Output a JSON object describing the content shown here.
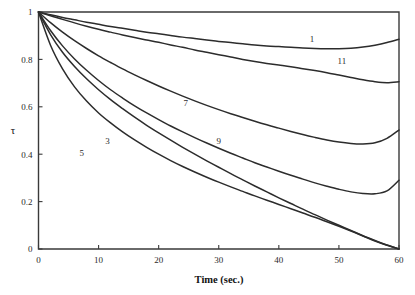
{
  "chart_data": {
    "type": "line",
    "title": "",
    "xlabel": "Time (sec.)",
    "ylabel": "τ",
    "xlim": [
      0,
      60
    ],
    "ylim": [
      0,
      1
    ],
    "xticks": [
      "0",
      "10",
      "20",
      "30",
      "40",
      "50",
      "60"
    ],
    "xtick_values": [
      0,
      10,
      20,
      30,
      40,
      50,
      60
    ],
    "yticks": [
      "0",
      "0.2",
      "0.4",
      "0.6",
      "0.8",
      "1"
    ],
    "ytick_values": [
      0,
      0.2,
      0.4,
      0.6,
      0.8,
      1
    ],
    "grid": false,
    "legend_position": "inline-curve-labels",
    "line_color": "#2c2c2c",
    "axis_color": "#3a3a3a",
    "x": [
      0,
      2,
      4,
      6,
      8,
      10,
      12,
      14,
      16,
      18,
      20,
      22,
      24,
      26,
      28,
      30,
      32,
      34,
      36,
      38,
      40,
      42,
      44,
      46,
      48,
      50,
      52,
      54,
      56,
      58,
      60
    ],
    "series": [
      {
        "name": "1",
        "label": "1",
        "label_x": 45.5,
        "label_y": 0.885,
        "values": [
          1.0,
          0.988,
          0.977,
          0.967,
          0.957,
          0.948,
          0.939,
          0.931,
          0.923,
          0.915,
          0.908,
          0.901,
          0.894,
          0.888,
          0.882,
          0.876,
          0.871,
          0.866,
          0.861,
          0.857,
          0.854,
          0.851,
          0.848,
          0.846,
          0.845,
          0.845,
          0.847,
          0.852,
          0.86,
          0.871,
          0.885
        ]
      },
      {
        "name": "3",
        "label": "3",
        "label_x": 11.5,
        "label_y": 0.455,
        "values": [
          1.0,
          0.905,
          0.83,
          0.77,
          0.718,
          0.672,
          0.63,
          0.592,
          0.556,
          0.522,
          0.49,
          0.459,
          0.429,
          0.4,
          0.372,
          0.345,
          0.318,
          0.292,
          0.266,
          0.241,
          0.216,
          0.192,
          0.168,
          0.145,
          0.122,
          0.1,
          0.078,
          0.056,
          0.036,
          0.017,
          0.0
        ]
      },
      {
        "name": "5",
        "label": "5",
        "label_x": 7.2,
        "label_y": 0.405,
        "values": [
          1.0,
          0.86,
          0.76,
          0.684,
          0.624,
          0.574,
          0.532,
          0.494,
          0.46,
          0.429,
          0.4,
          0.373,
          0.348,
          0.325,
          0.303,
          0.282,
          0.262,
          0.243,
          0.224,
          0.206,
          0.188,
          0.17,
          0.152,
          0.134,
          0.115,
          0.096,
          0.076,
          0.055,
          0.034,
          0.016,
          0.0
        ]
      },
      {
        "name": "7",
        "label": "7",
        "label_x": 24.5,
        "label_y": 0.618,
        "values": [
          1.0,
          0.955,
          0.915,
          0.879,
          0.846,
          0.815,
          0.787,
          0.76,
          0.735,
          0.711,
          0.688,
          0.666,
          0.645,
          0.625,
          0.606,
          0.588,
          0.571,
          0.555,
          0.539,
          0.524,
          0.51,
          0.496,
          0.483,
          0.471,
          0.46,
          0.451,
          0.445,
          0.443,
          0.448,
          0.467,
          0.502
        ]
      },
      {
        "name": "9",
        "label": "9",
        "label_x": 30.0,
        "label_y": 0.455,
        "values": [
          1.0,
          0.922,
          0.857,
          0.802,
          0.754,
          0.711,
          0.672,
          0.637,
          0.604,
          0.574,
          0.546,
          0.519,
          0.494,
          0.47,
          0.447,
          0.425,
          0.404,
          0.384,
          0.364,
          0.346,
          0.328,
          0.311,
          0.295,
          0.279,
          0.265,
          0.252,
          0.241,
          0.234,
          0.233,
          0.245,
          0.29
        ]
      },
      {
        "name": "11",
        "label": "11",
        "label_x": 50.5,
        "label_y": 0.795,
        "values": [
          1.0,
          0.984,
          0.969,
          0.954,
          0.94,
          0.927,
          0.915,
          0.903,
          0.892,
          0.882,
          0.872,
          0.861,
          0.851,
          0.84,
          0.83,
          0.82,
          0.81,
          0.8,
          0.791,
          0.783,
          0.776,
          0.769,
          0.761,
          0.753,
          0.744,
          0.734,
          0.724,
          0.714,
          0.706,
          0.702,
          0.706
        ]
      }
    ]
  }
}
